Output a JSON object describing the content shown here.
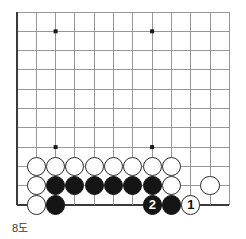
{
  "figure": {
    "caption": "8도",
    "kind": "go-board-diagram"
  },
  "board": {
    "colors": {
      "grid_line": "#8c8c8c",
      "edge_line": "#3a3a3a",
      "star_point": "#1a1a1a",
      "black_stone": "#151515",
      "white_stone": "#ffffff",
      "stone_outline": "#2b2b2b",
      "background": "#ffffff"
    },
    "geometry": {
      "origin_x": 17,
      "origin_y": 12,
      "spacing": 19.3,
      "columns": 12,
      "rows": 11,
      "stone_radius": 9.6
    },
    "edges": {
      "left": true,
      "bottom": true,
      "top": false,
      "right": false
    },
    "star_points": [
      {
        "col": 3,
        "row": 2
      },
      {
        "col": 8,
        "row": 2
      },
      {
        "col": 3,
        "row": 8
      },
      {
        "col": 8,
        "row": 8
      }
    ],
    "stones": [
      {
        "col": 2,
        "row": 9,
        "color": "white",
        "label": ""
      },
      {
        "col": 3,
        "row": 9,
        "color": "white",
        "label": ""
      },
      {
        "col": 4,
        "row": 9,
        "color": "white",
        "label": ""
      },
      {
        "col": 5,
        "row": 9,
        "color": "white",
        "label": ""
      },
      {
        "col": 6,
        "row": 9,
        "color": "white",
        "label": ""
      },
      {
        "col": 7,
        "row": 9,
        "color": "white",
        "label": ""
      },
      {
        "col": 8,
        "row": 9,
        "color": "white",
        "label": ""
      },
      {
        "col": 9,
        "row": 9,
        "color": "white",
        "label": ""
      },
      {
        "col": 2,
        "row": 10,
        "color": "white",
        "label": ""
      },
      {
        "col": 3,
        "row": 10,
        "color": "black",
        "label": ""
      },
      {
        "col": 4,
        "row": 10,
        "color": "black",
        "label": ""
      },
      {
        "col": 5,
        "row": 10,
        "color": "black",
        "label": ""
      },
      {
        "col": 6,
        "row": 10,
        "color": "black",
        "label": ""
      },
      {
        "col": 7,
        "row": 10,
        "color": "black",
        "label": ""
      },
      {
        "col": 8,
        "row": 10,
        "color": "black",
        "label": ""
      },
      {
        "col": 9,
        "row": 10,
        "color": "white",
        "label": ""
      },
      {
        "col": 11,
        "row": 10,
        "color": "white",
        "label": ""
      },
      {
        "col": 2,
        "row": 11,
        "color": "white",
        "label": ""
      },
      {
        "col": 3,
        "row": 11,
        "color": "black",
        "label": ""
      },
      {
        "col": 8,
        "row": 11,
        "color": "black",
        "label": "2"
      },
      {
        "col": 9,
        "row": 11,
        "color": "black",
        "label": ""
      },
      {
        "col": 10,
        "row": 11,
        "color": "white",
        "label": "1"
      }
    ],
    "moves": [
      {
        "number": "1",
        "color": "white"
      },
      {
        "number": "2",
        "color": "black"
      }
    ]
  }
}
